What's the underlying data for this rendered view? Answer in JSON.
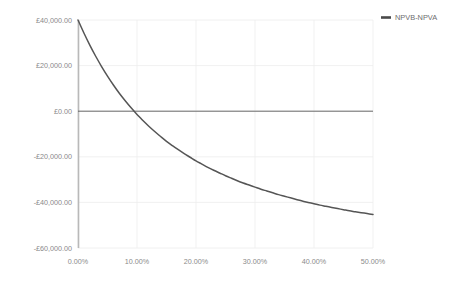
{
  "chart_data": {
    "type": "line",
    "title": "",
    "subtitle": "",
    "xlabel": "",
    "ylabel": "",
    "grid": true,
    "legend_position": "top-right",
    "xlim": [
      0,
      0.5
    ],
    "ylim": [
      -60000,
      40000
    ],
    "x_tick_labels": [
      "0.00%",
      "10.00%",
      "20.00%",
      "30.00%",
      "40.00%",
      "50.00%"
    ],
    "x_tick_values": [
      0,
      0.1,
      0.2,
      0.3,
      0.4,
      0.5
    ],
    "y_tick_labels": [
      "£40,000.00",
      "£20,000.00",
      "£0.00",
      "-£20,000.00",
      "-£40,000.00",
      "-£60,000.00"
    ],
    "y_tick_values": [
      40000,
      20000,
      0,
      -20000,
      -40000,
      -60000
    ],
    "zero_line_value": 0,
    "series": [
      {
        "name": "NPVB-NPVA",
        "color": "#555555",
        "x": [
          0,
          0.01,
          0.02,
          0.03,
          0.04,
          0.05,
          0.06,
          0.07,
          0.08,
          0.09,
          0.1,
          0.105,
          0.11,
          0.12,
          0.13,
          0.14,
          0.15,
          0.16,
          0.17,
          0.18,
          0.19,
          0.2,
          0.21,
          0.22,
          0.23,
          0.24,
          0.25,
          0.26,
          0.27,
          0.28,
          0.29,
          0.3,
          0.31,
          0.32,
          0.33,
          0.34,
          0.35,
          0.36,
          0.37,
          0.38,
          0.39,
          0.4,
          0.41,
          0.42,
          0.43,
          0.44,
          0.45,
          0.46,
          0.47,
          0.48,
          0.49,
          0.5
        ],
        "values": [
          40000,
          34300,
          29000,
          24100,
          19600,
          15400,
          11500,
          7900,
          4600,
          1500,
          -1400,
          -2750,
          -4100,
          -6600,
          -8900,
          -11100,
          -13200,
          -15100,
          -16900,
          -18600,
          -20200,
          -21800,
          -23200,
          -24600,
          -25900,
          -27100,
          -28300,
          -29400,
          -30500,
          -31500,
          -32400,
          -33300,
          -34200,
          -35000,
          -35800,
          -36600,
          -37300,
          -38000,
          -38700,
          -39400,
          -40000,
          -40600,
          -41200,
          -41700,
          -42200,
          -42700,
          -43200,
          -43700,
          -44100,
          -44500,
          -44900,
          -45300
        ]
      }
    ],
    "annotations": {
      "zero_crossing_x": "10.50%",
      "start_value": "£40,000.00",
      "end_value": "-£56,000.00"
    }
  },
  "legend": {
    "entries": [
      {
        "label": "NPVB-NPVA",
        "swatch_color": "#4a4a4a"
      }
    ]
  },
  "colors": {
    "background": "#ffffff",
    "grid": "#ececec",
    "axis": "#b9b9b9",
    "zero_line": "#5a5a5a",
    "tick_text": "#8a8a8a",
    "legend_text": "#6e6e6e",
    "series_line": "#555555"
  }
}
